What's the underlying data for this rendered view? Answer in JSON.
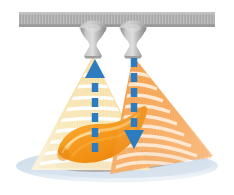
{
  "illustration": {
    "title": "Dual ultrasonic transducer acoustic levitation / scanning diagram",
    "canvas": {
      "width": 234,
      "height": 195,
      "background": "#ffffff"
    },
    "ceiling_bar": {
      "label": "mounting rail",
      "x": 19,
      "y": 12,
      "width": 196,
      "height": 15,
      "fill": "#a8a8a8",
      "hatch_fill": "#bdbdbd"
    },
    "transducers": [
      {
        "name": "left-transducer",
        "label": "left emitter",
        "cx": 93,
        "top_y": 26,
        "bottom_y": 56,
        "dome_rx": 13,
        "dome_ry": 7,
        "neck_half": 3.5,
        "mouth_half": 9,
        "body_fill": "#b2b2b2",
        "highlight_fill": "#d6d6d6",
        "shade_fill": "#949494"
      },
      {
        "name": "right-transducer",
        "label": "right emitter",
        "cx": 133,
        "top_y": 26,
        "bottom_y": 56,
        "dome_rx": 13,
        "dome_ry": 7,
        "neck_half": 3.5,
        "mouth_half": 9,
        "body_fill": "#b2b2b2",
        "highlight_fill": "#d6d6d6",
        "shade_fill": "#949494"
      }
    ],
    "beams": [
      {
        "name": "left-beam",
        "label": "pale yellow wavefront fan",
        "color": "#f6dfa4",
        "color_light": "#fbeecd",
        "apex_x": 93,
        "apex_y": 56,
        "left_angle_deg": -64,
        "right_angle_deg": 6,
        "length": 125,
        "arc_count": 9,
        "arc_stroke": "#ffffff",
        "arc_stroke_width": 3.2
      },
      {
        "name": "right-beam",
        "label": "orange wavefront fan",
        "color": "#f6a24a",
        "color_light": "#f9c68e",
        "apex_x": 133,
        "apex_y": 56,
        "left_angle_deg": -8,
        "right_angle_deg": 60,
        "length": 128,
        "arc_count": 10,
        "arc_stroke": "#ffffff",
        "arc_stroke_width": 3.2
      }
    ],
    "arrows": [
      {
        "name": "up-arrow",
        "label": "upward dashed arrow",
        "direction": "up",
        "x": 95,
        "tip_y": 60,
        "tail_y": 152,
        "color": "#2d7cbf",
        "shaft_width": 6,
        "head_width": 18,
        "head_height": 15,
        "dash": "9 6"
      },
      {
        "name": "down-arrow",
        "label": "downward dashed arrow",
        "direction": "down",
        "x": 134,
        "tip_y": 148,
        "tail_y": 58,
        "color": "#2d7cbf",
        "shaft_width": 6,
        "head_width": 18,
        "head_height": 15,
        "dash": "9 6"
      }
    ],
    "object": {
      "name": "levitated-object",
      "label": "orange banana-shaped specimen",
      "fill": "#f5941f",
      "fill_light": "#fbbd5a",
      "fill_dark": "#e07c10",
      "highlight": "#fdd48a"
    },
    "base": {
      "name": "stage-surface",
      "label": "pale blue stage plane",
      "fill": "#cfdcea",
      "fill_edge": "#dfe8f2",
      "shadow_fill": "#9a8f88",
      "cx": 117,
      "cy": 166,
      "rx": 100,
      "ry": 16
    },
    "palette": {
      "blue_arrow": "#2d7cbf",
      "orange_beam": "#f6a24a",
      "yellow_beam": "#f6dfa4",
      "object_orange": "#f5941f",
      "stage_blue": "#cfdcea",
      "rail_gray": "#a8a8a8",
      "white": "#ffffff"
    }
  }
}
